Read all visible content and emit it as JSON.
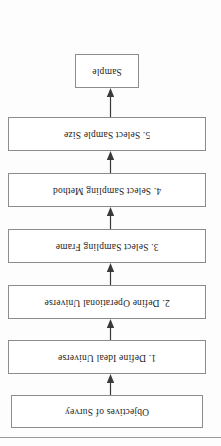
{
  "document": {
    "type": "flowchart",
    "orientation": "rotated-180",
    "title": "Steps in Sampling Process"
  },
  "flow": {
    "nodes": [
      {
        "id": "objectives",
        "label": "Objectives of Survey"
      },
      {
        "id": "step1",
        "label": "1.  Define Ideal Universe"
      },
      {
        "id": "step2",
        "label": "2.  Define Operational Universe"
      },
      {
        "id": "step3",
        "label": "3.  Select Sampling Frame"
      },
      {
        "id": "step4",
        "label": "4.  Select Sampling Method"
      },
      {
        "id": "step5",
        "label": "5.  Select Sample Size"
      },
      {
        "id": "sample",
        "label": "Sample"
      }
    ],
    "connectors": [
      {
        "from": "objectives",
        "to": "step1",
        "kind": "arrow-down"
      },
      {
        "from": "step1",
        "to": "step2",
        "kind": "arrow-down"
      },
      {
        "from": "step2",
        "to": "step3",
        "kind": "arrow-down"
      },
      {
        "from": "step3",
        "to": "step4",
        "kind": "arrow-down"
      },
      {
        "from": "step4",
        "to": "step5",
        "kind": "arrow-down"
      },
      {
        "from": "step5",
        "to": "sample",
        "kind": "arrow-down"
      }
    ]
  },
  "colors": {
    "page_background": "#fdfdfd",
    "node_border": "#8c8c8c",
    "node_fill": "#ffffff",
    "text": "#1c1c1c",
    "connector": "#3a3a3a",
    "rule": "#9a9a9a"
  }
}
